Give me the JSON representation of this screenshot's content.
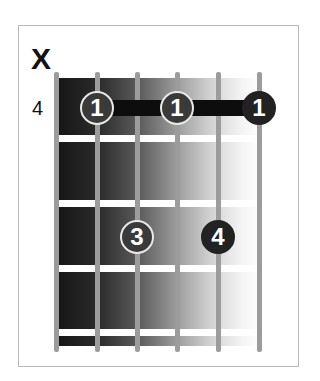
{
  "chord": {
    "muted_string_marker": "X",
    "start_fret": "4",
    "strings": 6,
    "frets_shown": 4,
    "barre": {
      "fret": 1,
      "from_string": 2,
      "to_string": 6
    },
    "fingers": [
      {
        "string": 2,
        "fret": 1,
        "label": "1"
      },
      {
        "string": 4,
        "fret": 1,
        "label": "1"
      },
      {
        "string": 6,
        "fret": 1,
        "label": "1"
      },
      {
        "string": 3,
        "fret": 3,
        "label": "3"
      },
      {
        "string": 5,
        "fret": 3,
        "label": "4"
      }
    ]
  },
  "colors": {
    "dot_fill": "#3a3a3a",
    "dot_outline": "#e8e8e8",
    "barre": "#0d0d0d",
    "string": "#9c9c9c",
    "fret": "#ffffff"
  }
}
